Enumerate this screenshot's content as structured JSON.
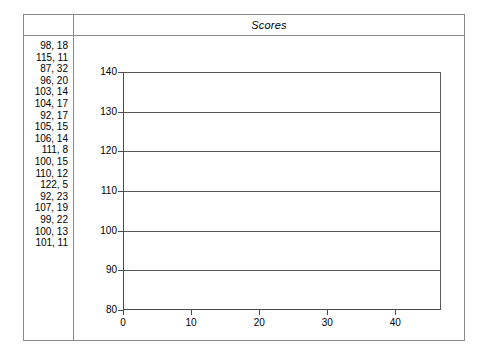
{
  "header": {
    "title": "Scores",
    "left_cell_label": ""
  },
  "data_list": {
    "name": "score-pairs",
    "rows": [
      "98, 18",
      "115, 11",
      "87, 32",
      "96, 20",
      "103, 14",
      "104, 17",
      "92, 17",
      "105, 15",
      "106, 14",
      "111, 8",
      "100, 15",
      "110, 12",
      "122, 5",
      "92, 23",
      "107, 19",
      "99, 22",
      "100, 13",
      "101, 11"
    ]
  },
  "chart_data": {
    "type": "scatter",
    "title": "Scores",
    "xlabel": "",
    "ylabel": "",
    "xlim": [
      0,
      46.7
    ],
    "ylim": [
      80,
      140
    ],
    "xticks": [
      0,
      10,
      20,
      30,
      40
    ],
    "yticks": [
      80,
      90,
      100,
      110,
      120,
      130,
      140
    ],
    "gridlines_y": [
      90,
      100,
      110,
      120,
      130,
      140
    ],
    "grid": true,
    "legend": "none",
    "series": [
      {
        "name": "scores",
        "points": [
          [
            98,
            18
          ],
          [
            115,
            11
          ],
          [
            87,
            32
          ],
          [
            96,
            20
          ],
          [
            103,
            14
          ],
          [
            104,
            17
          ],
          [
            92,
            17
          ],
          [
            105,
            15
          ],
          [
            106,
            14
          ],
          [
            111,
            8
          ],
          [
            100,
            15
          ],
          [
            110,
            12
          ],
          [
            122,
            5
          ],
          [
            92,
            23
          ],
          [
            107,
            19
          ],
          [
            99,
            22
          ],
          [
            100,
            13
          ],
          [
            101,
            11
          ]
        ],
        "rendered": false
      }
    ],
    "note": "Plot area is empty - no data markers rendered; only axes and horizontal gridlines are drawn."
  },
  "colors": {
    "frame_border": "#8a8a8a",
    "axis": "#4a4a4a",
    "gridline": "#565656",
    "background": "#ffffff",
    "text": "#000000"
  }
}
